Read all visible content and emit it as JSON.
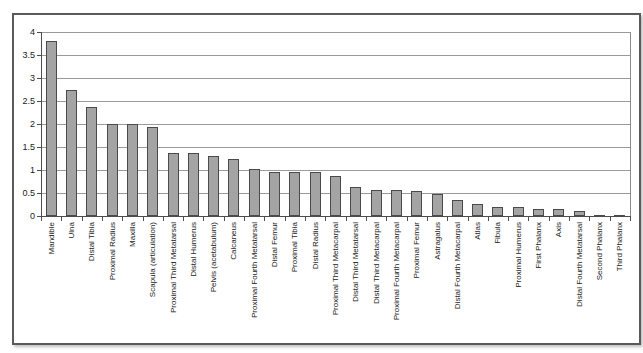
{
  "chart_data": {
    "type": "bar",
    "title": "",
    "xlabel": "",
    "ylabel": "",
    "categories": [
      "Mandible",
      "Ulna",
      "Distal Tibia",
      "Proximal Radius",
      "Maxilla",
      "Scapula (articulation)",
      "Proximal Third Metatarsal",
      "Distal Humerus",
      "Pelvis (acetabulum)",
      "Calcaneus",
      "Proximal Fourth Metatarsal",
      "Distal Femur",
      "Proximal Tibia",
      "Distal Radius",
      "Proximal Third Metacarpal",
      "Distal Third Metatarsal",
      "Distal Third Metacarpal",
      "Proximal Fourth Metacarpal",
      "Proximal Femur",
      "Astragalus",
      "Distal Fourth Metacarpal",
      "Atlas",
      "Fibula",
      "Proximal Humerus",
      "First Phalanx",
      "Axis",
      "Distal Fourth Metatarsal",
      "Second Phalanx",
      "Third Phalanx"
    ],
    "values": [
      3.8,
      2.73,
      2.37,
      2.0,
      2.0,
      1.93,
      1.37,
      1.37,
      1.3,
      1.23,
      1.02,
      0.95,
      0.95,
      0.95,
      0.87,
      0.64,
      0.57,
      0.57,
      0.55,
      0.48,
      0.35,
      0.27,
      0.2,
      0.2,
      0.16,
      0.15,
      0.1,
      0.03,
      0.01
    ],
    "ylim": [
      0,
      4
    ],
    "ytick_step": 0.5,
    "ytick_labels": [
      "0",
      "0.5",
      "1",
      "1.5",
      "2",
      "2.5",
      "3",
      "3.5",
      "4"
    ],
    "grid": "horizontal",
    "legend": "none",
    "colors": {
      "bar_fill": "#a4a4a4",
      "bar_border": "#4a4a4a",
      "gridline": "#9a9a9a",
      "axis": "#4d4d4d",
      "frame_border": "#5a5a5a",
      "background": "#ffffff"
    }
  }
}
